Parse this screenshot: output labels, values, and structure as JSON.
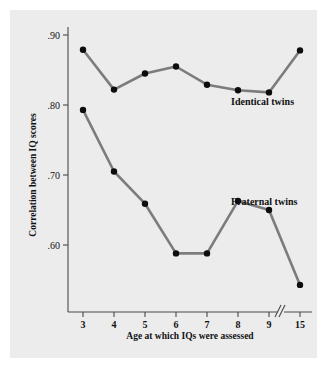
{
  "figure": {
    "background_color": "#ffffff",
    "panel_color": "#ececed",
    "line_color": "#7c7c7c",
    "point_color": "#0d0d0d",
    "axis_color": "#4a4a4a"
  },
  "chart_data": {
    "type": "line",
    "title": "",
    "xlabel": "Age at which IQs were assessed",
    "ylabel": "Correlation between IQ scores",
    "x": [
      3,
      4,
      5,
      6,
      7,
      8,
      9,
      15
    ],
    "xtick_labels": [
      "3",
      "4",
      "5",
      "6",
      "7",
      "8",
      "9",
      "15"
    ],
    "ytick_labels": [
      ".90",
      ".80",
      ".70",
      ".60"
    ],
    "yticks": [
      0.9,
      0.8,
      0.7,
      0.6
    ],
    "ylim": [
      0.52,
      0.92
    ],
    "grid": false,
    "axis_break": {
      "present": true,
      "symbol": "//",
      "between": [
        9,
        15
      ]
    },
    "legend_position": "inline-right",
    "series": [
      {
        "name": "Identical twins",
        "label": "Identical twins",
        "values": [
          0.879,
          0.822,
          0.845,
          0.855,
          0.829,
          0.821,
          0.818,
          0.878
        ]
      },
      {
        "name": "Fraternal twins",
        "label": "Fraternal twins",
        "values": [
          0.793,
          0.705,
          0.659,
          0.588,
          0.588,
          0.663,
          0.65,
          0.543
        ]
      }
    ]
  }
}
